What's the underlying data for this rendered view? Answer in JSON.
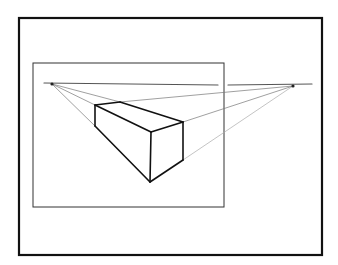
{
  "figure": {
    "background": "#ffffff",
    "ink": "#111111",
    "guide_color": "#777777",
    "outer_frame": {
      "x": 19,
      "y": 18,
      "w": 303,
      "h": 237
    },
    "inner_frame": {
      "x": 33,
      "y": 63,
      "w": 191,
      "h": 144
    },
    "horizon": [
      {
        "x1": 44,
        "y1": 83,
        "x2": 218,
        "y2": 85
      },
      {
        "x1": 228,
        "y1": 85,
        "x2": 312,
        "y2": 84
      }
    ],
    "vanishing_points": {
      "left": {
        "x": 52,
        "y": 84
      },
      "right": {
        "x": 293,
        "y": 86
      }
    },
    "box": {
      "back_left_top": {
        "x": 95,
        "y": 105
      },
      "back_right_top": {
        "x": 120,
        "y": 102
      },
      "right_top": {
        "x": 183,
        "y": 122
      },
      "front_top": {
        "x": 151,
        "y": 132
      },
      "back_left_bottom": {
        "x": 95,
        "y": 126
      },
      "front_bottom": {
        "x": 150,
        "y": 182
      },
      "right_bottom": {
        "x": 183,
        "y": 160
      }
    }
  }
}
